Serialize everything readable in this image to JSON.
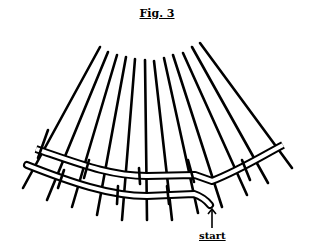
{
  "figure": {
    "title": "Fig. 3",
    "start_label": "start",
    "arrow_icon": "up-arrow-icon",
    "stake_count": 12,
    "weaver_count": 2,
    "colors": {
      "ink": "#000000",
      "background": "#ffffff"
    }
  }
}
